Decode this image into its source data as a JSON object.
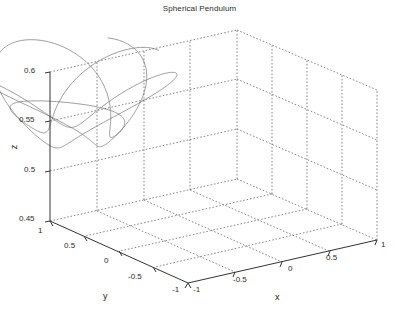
{
  "figure": {
    "title": "Spherical Pendulum",
    "background_color": "#ffffff",
    "line_color": "#6e6e6e",
    "axis_color": "#333333",
    "grid_color": "#555555",
    "text_color": "#2b2b2b"
  },
  "axes": {
    "z": {
      "label": "z",
      "ticks": [
        "0.45",
        "0.5",
        "0.55",
        "0.6"
      ],
      "range": [
        0.45,
        0.6
      ]
    },
    "y": {
      "label": "y",
      "ticks": [
        "1",
        "0.5",
        "0",
        "-0.5",
        "-1"
      ],
      "range": [
        -1,
        1
      ]
    },
    "x": {
      "label": "x",
      "ticks": [
        "-1",
        "-0.5",
        "0",
        "0.5",
        "1"
      ],
      "range": [
        -1,
        1
      ]
    }
  },
  "chart_data": {
    "type": "line",
    "title": "Spherical Pendulum",
    "xlabel": "x",
    "ylabel": "y",
    "zlabel": "z",
    "grid": true,
    "legend": null,
    "xlim": [
      -1,
      1
    ],
    "ylim": [
      -1,
      1
    ],
    "zlim": [
      0.45,
      0.6
    ],
    "xticks": [
      -1,
      -0.5,
      0,
      0.5,
      1
    ],
    "yticks": [
      -1,
      -0.5,
      0,
      0.5,
      1
    ],
    "zticks": [
      0.45,
      0.5,
      0.55,
      0.6
    ],
    "projection": "3d",
    "view_azimuth_deg": -37.5,
    "view_elevation_deg": 30,
    "series": [
      {
        "name": "bob trajectory",
        "color": "#6e6e6e",
        "style": "solid",
        "width": 0.7,
        "parametric": {
          "model": "precessing-ellipse-on-sphere",
          "r_outer": 0.88,
          "r_inner": 0.3,
          "theta_cycles": 5.0,
          "precession_rate": 0.62,
          "z_center": 0.515,
          "z_amplitude": 0.035,
          "t_start": 0,
          "t_end": 31.4,
          "samples": 1400
        }
      }
    ]
  }
}
